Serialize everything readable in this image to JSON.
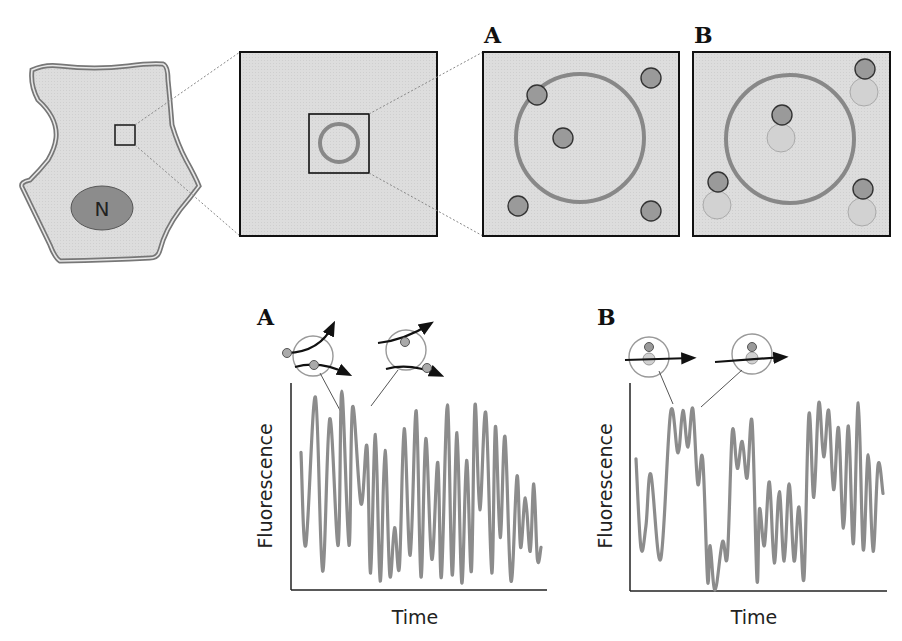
{
  "figure": {
    "top_row": {
      "cell": {
        "nucleus_label": "N"
      },
      "panel_a": {
        "letter": "A"
      },
      "panel_b": {
        "letter": "B"
      }
    },
    "bottom_row": {
      "plot_a": {
        "letter": "A",
        "ylabel": "Fluorescence",
        "xlabel": "Time"
      },
      "plot_b": {
        "letter": "B",
        "ylabel": "Fluorescence",
        "xlabel": "Time"
      }
    },
    "colors": {
      "cell_fill": "#dcdcdc",
      "outline_gray": "#8a8a8a",
      "nucleus_fill": "#8c8c8c",
      "ring_gray": "#888888",
      "particle_dark": "#9a9a9a",
      "particle_light": "#d0d0d0",
      "trace_gray": "#8c8c8c",
      "box_fill": "#dedede"
    }
  },
  "chart_data": [
    {
      "type": "line",
      "title": "A",
      "xlabel": "Time",
      "ylabel": "Fluorescence",
      "grid": false,
      "note": "Rapid uncorrelated fluctuations; relative amplitudes 0-1, peaks/troughs read approximately",
      "x": [
        0,
        0.02,
        0.06,
        0.09,
        0.12,
        0.155,
        0.17,
        0.2,
        0.215,
        0.25,
        0.275,
        0.29,
        0.31,
        0.33,
        0.35,
        0.37,
        0.39,
        0.41,
        0.43,
        0.455,
        0.48,
        0.5,
        0.52,
        0.545,
        0.57,
        0.585,
        0.61,
        0.63,
        0.65,
        0.67,
        0.69,
        0.71,
        0.725,
        0.745,
        0.77,
        0.795,
        0.81,
        0.83,
        0.85,
        0.875,
        0.9,
        0.915,
        0.935,
        0.955,
        0.97,
        0.985,
        1.0
      ],
      "values": [
        0.68,
        0.21,
        0.96,
        0.08,
        0.85,
        0.21,
        0.99,
        0.21,
        0.91,
        0.42,
        0.71,
        0.07,
        0.77,
        0.03,
        0.69,
        0.06,
        0.3,
        0.1,
        0.8,
        0.16,
        0.89,
        0.05,
        0.75,
        0.14,
        0.63,
        0.05,
        0.92,
        0.06,
        0.78,
        0.02,
        0.64,
        0.08,
        0.92,
        0.39,
        0.88,
        0.07,
        0.81,
        0.25,
        0.76,
        0.03,
        0.56,
        0.2,
        0.45,
        0.18,
        0.52,
        0.14,
        0.2
      ]
    },
    {
      "type": "line",
      "title": "B",
      "xlabel": "Time",
      "ylabel": "Fluorescence",
      "grid": false,
      "note": "Step-like plateaus with small oscillations; relative amplitudes 0-1, read approximately",
      "x": [
        0,
        0.02,
        0.04,
        0.06,
        0.1,
        0.14,
        0.17,
        0.19,
        0.21,
        0.23,
        0.25,
        0.27,
        0.29,
        0.3,
        0.32,
        0.35,
        0.37,
        0.39,
        0.41,
        0.43,
        0.45,
        0.47,
        0.49,
        0.5,
        0.52,
        0.54,
        0.56,
        0.58,
        0.6,
        0.62,
        0.64,
        0.66,
        0.68,
        0.7,
        0.72,
        0.74,
        0.76,
        0.78,
        0.8,
        0.82,
        0.84,
        0.86,
        0.88,
        0.9,
        0.92,
        0.94,
        0.96,
        0.98,
        1.0
      ],
      "values": [
        0.68,
        0.22,
        0.33,
        0.6,
        0.16,
        0.92,
        0.71,
        0.93,
        0.74,
        0.94,
        0.55,
        0.68,
        0.05,
        0.23,
        0.0,
        0.25,
        0.18,
        0.82,
        0.63,
        0.77,
        0.58,
        0.87,
        0.05,
        0.42,
        0.23,
        0.56,
        0.14,
        0.51,
        0.15,
        0.55,
        0.15,
        0.43,
        0.06,
        0.91,
        0.48,
        0.97,
        0.69,
        0.93,
        0.52,
        0.84,
        0.32,
        0.85,
        0.24,
        0.97,
        0.21,
        0.7,
        0.2,
        0.65,
        0.5
      ]
    }
  ]
}
